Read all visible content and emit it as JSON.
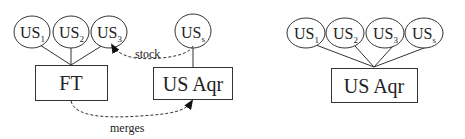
{
  "left_diagram": {
    "ellipses": [
      {
        "base": "US",
        "sub": "1"
      },
      {
        "base": "US",
        "sub": "2"
      },
      {
        "base": "US",
        "sub": "3"
      },
      {
        "base": "US",
        "sub": "s"
      }
    ],
    "boxes": [
      {
        "label": "FT"
      },
      {
        "label": "US Aqr"
      }
    ],
    "edges": [
      {
        "from": "US_s",
        "to": "US_3",
        "label": "stock",
        "style": "dashed"
      },
      {
        "from": "FT",
        "to": "US Aqr",
        "label": "merges",
        "style": "dashed"
      }
    ]
  },
  "right_diagram": {
    "ellipses": [
      {
        "base": "US",
        "sub": "1"
      },
      {
        "base": "US",
        "sub": "2"
      },
      {
        "base": "US",
        "sub": "3"
      },
      {
        "base": "US",
        "sub": "s"
      }
    ],
    "boxes": [
      {
        "label": "US Aqr"
      }
    ]
  }
}
